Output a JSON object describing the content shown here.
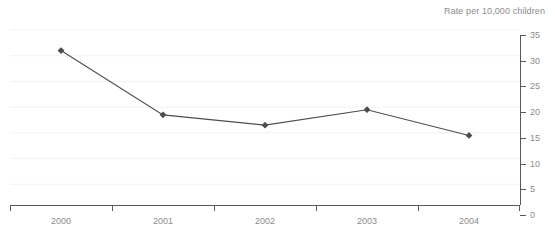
{
  "chart_data": {
    "type": "line",
    "title": "Rate per 10,000 children",
    "xlabel": "",
    "ylabel": "",
    "categories": [
      "2000",
      "2001",
      "2002",
      "2003",
      "2004"
    ],
    "values": [
      31,
      18.5,
      16.5,
      19.5,
      14.5
    ],
    "ylim": [
      0,
      35
    ],
    "yticks": [
      0,
      5,
      10,
      15,
      20,
      25,
      30,
      35
    ],
    "ytick_labels": [
      "0",
      "5",
      "10",
      "15",
      "20",
      "25",
      "30",
      "35"
    ],
    "grid": true,
    "legend": "none",
    "y_axis_position": "right",
    "marker": "diamond",
    "series_color": "#4d4d4d",
    "grid_color": "#f2f2f2",
    "axis_color": "#5a5a5a",
    "label_color": "#8c8c8c"
  }
}
